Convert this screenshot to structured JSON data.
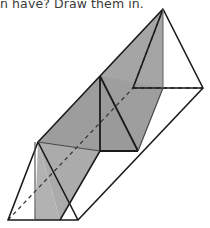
{
  "page": {
    "background_color": "#ffffff",
    "width": 210,
    "height": 228
  },
  "prompt": {
    "text": "n have? Draw them in.",
    "full_text_note": "partially cropped at top of image",
    "color": "#3a3a3a"
  },
  "figure": {
    "name": "triangular-prism-with-cross-sections",
    "projection": "oblique",
    "stroke_color": "#1a1a1a",
    "hidden_edge_style": "dashed",
    "fill_light_gray": "#b4b4b4",
    "fill_mid_gray": "#a0a0a0",
    "fill_dark_gray": "#8e8e8e",
    "fill_white": "#ffffff",
    "vertices": {
      "front_bottom_left": [
        8,
        220
      ],
      "front_bottom_right": [
        78,
        220
      ],
      "front_apex": [
        38,
        142
      ],
      "back_bottom_left": [
        133,
        88
      ],
      "back_bottom_right": [
        203,
        88
      ],
      "back_apex": [
        163,
        9
      ],
      "mid_apex": [
        100,
        76
      ],
      "mid_bottom_left": [
        100,
        151
      ],
      "mid_bottom_right": [
        138,
        151
      ]
    },
    "shaded_faces": [
      {
        "name": "diagonal-cross-section-plane",
        "fill": "#a8a8a8",
        "points": "38,142 163,9 163,88 100,151"
      },
      {
        "name": "perpendicular-triangular-cross-section",
        "fill": "#9a9a9a",
        "points": "100,76 138,151 100,151"
      },
      {
        "name": "left-vertical-slab",
        "fill": "#b0b0b0",
        "points": "38,142 100,76 100,151 60,220"
      }
    ],
    "edges": [
      {
        "name": "front-triangle-left",
        "type": "solid"
      },
      {
        "name": "front-triangle-right",
        "type": "solid"
      },
      {
        "name": "front-triangle-base",
        "type": "solid"
      },
      {
        "name": "top-ridge",
        "type": "solid"
      },
      {
        "name": "bottom-front-lateral",
        "type": "solid"
      },
      {
        "name": "back-triangle-left",
        "type": "solid"
      },
      {
        "name": "back-triangle-right",
        "type": "solid"
      },
      {
        "name": "back-base-hidden",
        "type": "dashed"
      },
      {
        "name": "hidden-bottom-lateral",
        "type": "dashed"
      },
      {
        "name": "diagonal-hidden-edge",
        "type": "dashed"
      }
    ]
  }
}
